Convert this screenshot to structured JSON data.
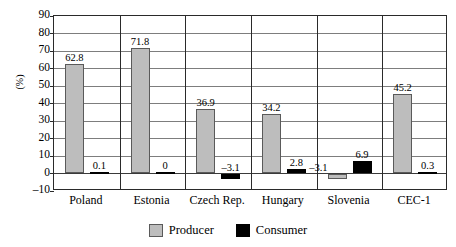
{
  "chart_data": {
    "type": "bar",
    "title": "",
    "xlabel": "",
    "ylabel": "(%)",
    "ylim": [
      -10,
      90
    ],
    "ytick_step": 10,
    "yticks": [
      "90",
      "80",
      "70",
      "60",
      "50",
      "40",
      "30",
      "20",
      "10",
      "0",
      "–10"
    ],
    "grid": true,
    "legend_position": "bottom-center",
    "categories": [
      "Poland",
      "Estonia",
      "Czech Rep.",
      "Hungary",
      "Slovenia",
      "CEC-1"
    ],
    "series": [
      {
        "name": "Producer",
        "color": "#bdbdbd",
        "values": [
          62.8,
          71.8,
          36.9,
          34.2,
          -3.1,
          45.2
        ],
        "labels": [
          "62.8",
          "71.8",
          "36.9",
          "34.2",
          "–3.1",
          "45.2"
        ]
      },
      {
        "name": "Consumer",
        "color": "#000000",
        "values": [
          0.1,
          0,
          -3.1,
          2.8,
          6.9,
          0.3
        ],
        "labels": [
          "0.1",
          "0",
          "–3.1",
          "2.8",
          "6.9",
          "0.3"
        ]
      }
    ]
  },
  "legend": {
    "entries": [
      {
        "label": "Producer",
        "swatch": "producer-swatch"
      },
      {
        "label": "Consumer",
        "swatch": "consumer-swatch"
      }
    ]
  }
}
